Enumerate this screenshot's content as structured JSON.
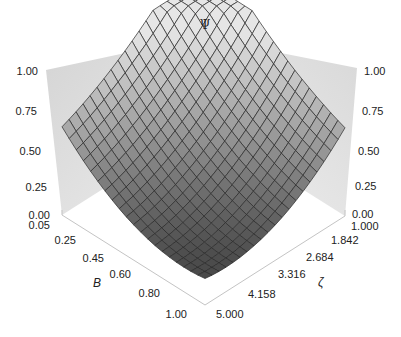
{
  "chart_data": {
    "type": "surface3d",
    "title": "",
    "zlabel": "Ψ",
    "xlabel": "B",
    "ylabel": "ζ",
    "x_axis": {
      "name": "B",
      "ticks": [
        "0.05",
        "0.25",
        "0.45",
        "0.60",
        "0.80",
        "1.00"
      ],
      "range": [
        0.05,
        1.0
      ]
    },
    "y_axis": {
      "name": "ζ",
      "ticks": [
        "1.000",
        "1.842",
        "2.684",
        "3.316",
        "4.158",
        "5.000"
      ],
      "range": [
        1.0,
        5.0
      ]
    },
    "z_axis": {
      "name": "Ψ",
      "ticks_left": [
        "0.00",
        "0.25",
        "0.50",
        "0.75",
        "1.00"
      ],
      "ticks_right": [
        "0.00",
        "0.25",
        "0.50",
        "0.75",
        "1.00"
      ],
      "range": [
        0.0,
        1.0
      ]
    },
    "surface_samples": {
      "description": "Approximate Ψ at the four corners of the (B, ζ) domain, read from the rendered surface",
      "corners": [
        {
          "B": 0.05,
          "zeta": 5.0,
          "psi": 1.0
        },
        {
          "B": 1.0,
          "zeta": 1.0,
          "psi": 1.0
        },
        {
          "B": 0.05,
          "zeta": 1.0,
          "psi": 0.6
        },
        {
          "B": 1.0,
          "zeta": 5.0,
          "psi": 0.45
        }
      ]
    },
    "mesh": {
      "rows": 20,
      "cols": 20
    },
    "grid": false,
    "colors": {
      "surface_light": "#e8e8e8",
      "surface_dark": "#3c3c3c",
      "mesh_line": "#2a2a2a",
      "wall": "#d8d8d8",
      "axis": "#bdbdbd"
    }
  }
}
